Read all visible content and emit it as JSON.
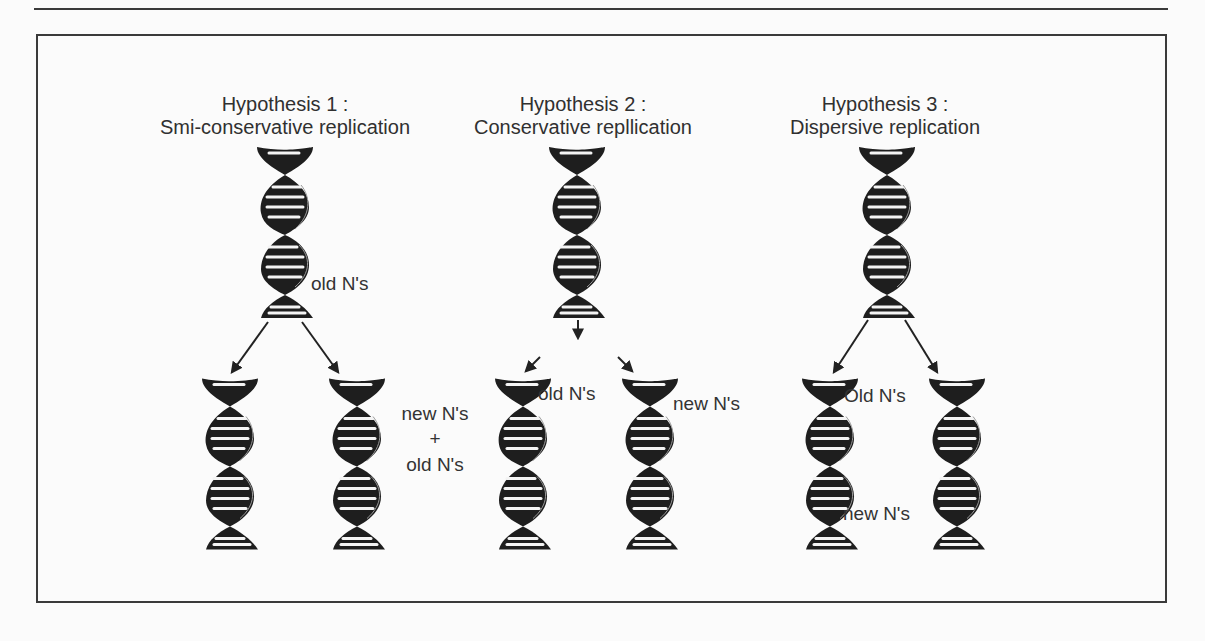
{
  "figure": {
    "type": "DNA replication hypotheses diagram",
    "hypotheses": [
      {
        "id": 1,
        "heading": "Hypothesis 1 :",
        "name": "Smi-conservative replication",
        "parent_label": "old N's",
        "daughter_label_lines": [
          "new N's",
          "+",
          "old N's"
        ]
      },
      {
        "id": 2,
        "heading": "Hypothesis 2 :",
        "name": "Conservative repllication",
        "daughter_labels": [
          "old N's",
          "new N's"
        ]
      },
      {
        "id": 3,
        "heading": "Hypothesis 3 :",
        "name": "Dispersive replication",
        "daughter_labels": [
          "Old N's",
          "new N's"
        ]
      }
    ],
    "colors": {
      "ink": "#2b2b2b",
      "frame": "#3a3a3a",
      "paper": "#fbfbfb",
      "helix": "#1e1e1e"
    }
  }
}
